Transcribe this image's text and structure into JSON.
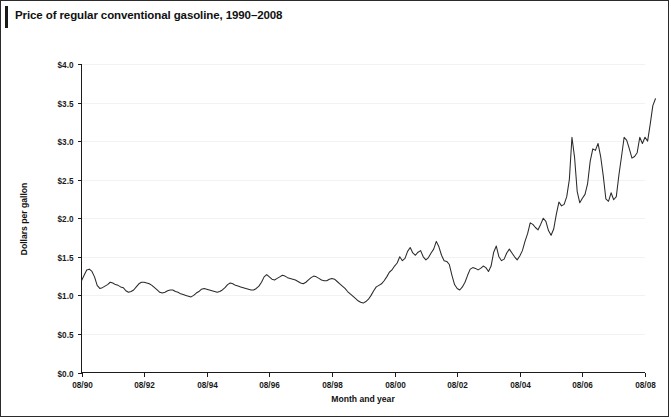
{
  "figure": {
    "title": "Price of regular conventional gasoline, 1990–2008",
    "border_color": "#2b2b2b",
    "background": "#ffffff"
  },
  "chart_data": {
    "type": "line",
    "title": "Price of regular conventional gasoline, 1990–2008",
    "xlabel": "Month and year",
    "ylabel": "Dollars per gallon",
    "xlim": [
      0,
      216
    ],
    "ylim": [
      0.0,
      4.0
    ],
    "grid": true,
    "legend": null,
    "line_color": "#2a2a2a",
    "y_ticks": [
      0.0,
      0.5,
      1.0,
      1.5,
      2.0,
      2.5,
      3.0,
      3.5,
      4.0
    ],
    "y_tick_labels": [
      "$0.0",
      "$0.5",
      "$1.0",
      "$1.5",
      "$2.0",
      "$2.5",
      "$3.0",
      "$3.5",
      "$4.0"
    ],
    "x_ticks": [
      0,
      24,
      48,
      72,
      96,
      120,
      144,
      168,
      192,
      216
    ],
    "x_tick_labels": [
      "08/90",
      "08/92",
      "08/94",
      "08/96",
      "08/98",
      "08/00",
      "08/02",
      "08/04",
      "08/06",
      "08/08"
    ],
    "x_start": "08/90",
    "x_end": "08/08",
    "x_unit": "months",
    "series": [
      {
        "name": "Regular conventional gasoline price",
        "units": "dollars per gallon",
        "values": [
          1.19,
          1.26,
          1.33,
          1.34,
          1.31,
          1.24,
          1.13,
          1.09,
          1.1,
          1.12,
          1.14,
          1.17,
          1.16,
          1.14,
          1.13,
          1.11,
          1.1,
          1.06,
          1.04,
          1.05,
          1.07,
          1.11,
          1.15,
          1.17,
          1.17,
          1.16,
          1.15,
          1.13,
          1.1,
          1.07,
          1.04,
          1.03,
          1.04,
          1.06,
          1.07,
          1.07,
          1.05,
          1.04,
          1.02,
          1.01,
          1.0,
          0.99,
          0.98,
          1.0,
          1.03,
          1.05,
          1.08,
          1.09,
          1.08,
          1.07,
          1.06,
          1.05,
          1.04,
          1.05,
          1.07,
          1.1,
          1.14,
          1.16,
          1.15,
          1.13,
          1.12,
          1.11,
          1.1,
          1.09,
          1.08,
          1.07,
          1.07,
          1.09,
          1.12,
          1.17,
          1.24,
          1.27,
          1.24,
          1.21,
          1.2,
          1.22,
          1.24,
          1.26,
          1.25,
          1.23,
          1.22,
          1.21,
          1.2,
          1.18,
          1.16,
          1.15,
          1.17,
          1.2,
          1.23,
          1.25,
          1.24,
          1.22,
          1.2,
          1.19,
          1.19,
          1.21,
          1.22,
          1.21,
          1.18,
          1.15,
          1.12,
          1.09,
          1.05,
          1.02,
          0.99,
          0.96,
          0.93,
          0.91,
          0.9,
          0.92,
          0.95,
          1.0,
          1.06,
          1.11,
          1.13,
          1.15,
          1.19,
          1.24,
          1.3,
          1.33,
          1.38,
          1.42,
          1.5,
          1.45,
          1.48,
          1.57,
          1.62,
          1.55,
          1.52,
          1.56,
          1.58,
          1.5,
          1.46,
          1.49,
          1.55,
          1.6,
          1.7,
          1.63,
          1.52,
          1.45,
          1.44,
          1.4,
          1.26,
          1.14,
          1.09,
          1.07,
          1.11,
          1.17,
          1.26,
          1.34,
          1.36,
          1.35,
          1.33,
          1.35,
          1.38,
          1.36,
          1.31,
          1.38,
          1.56,
          1.64,
          1.5,
          1.45,
          1.47,
          1.55,
          1.6,
          1.55,
          1.5,
          1.46,
          1.51,
          1.58,
          1.7,
          1.8,
          1.94,
          1.92,
          1.88,
          1.85,
          1.92,
          2.0,
          1.96,
          1.84,
          1.78,
          1.86,
          2.05,
          2.21,
          2.16,
          2.18,
          2.28,
          2.5,
          3.05,
          2.79,
          2.35,
          2.2,
          2.26,
          2.31,
          2.45,
          2.74,
          2.9,
          2.88,
          2.97,
          2.8,
          2.55,
          2.25,
          2.22,
          2.33,
          2.24,
          2.28,
          2.56,
          2.8,
          3.05,
          3.01,
          2.9,
          2.78,
          2.8,
          2.85,
          3.05,
          2.97,
          3.05,
          3.0,
          3.22,
          3.46,
          3.55
        ]
      }
    ],
    "notable_points": [
      {
        "label": "1990 Gulf War peak",
        "x_label": "11/90",
        "value": 1.34
      },
      {
        "label": "Late-1990s low",
        "x_label": "02/99",
        "value": 0.9
      },
      {
        "label": "Hurricane Katrina spike",
        "x_label": "09/05",
        "value": 3.05
      },
      {
        "label": "Series end",
        "x_label": "08/08",
        "value": 3.55
      }
    ]
  },
  "axes": {
    "y_axis_title": "Dollars per gallon",
    "x_axis_title": "Month and year"
  }
}
